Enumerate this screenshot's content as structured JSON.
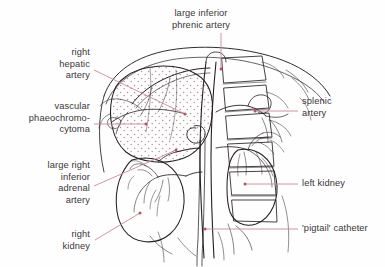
{
  "figure": {
    "kind": "medical-anatomical-illustration",
    "background_color": "#fefefe",
    "ink_color": "#262024",
    "leader_color": "#c98a95",
    "text_color": "#3a3538",
    "stipple_color": "#b9939c"
  },
  "labels": [
    {
      "id": "large-inferior-phrenic-artery",
      "lines": [
        "large inferior",
        "phrenic artery"
      ],
      "align": "center",
      "x": 138,
      "y": 8,
      "width": 126,
      "leader": {
        "from": [
          221,
          33
        ],
        "to": [
          221,
          69
        ]
      },
      "dot": [
        221,
        69
      ]
    },
    {
      "id": "right-hepatic-artery",
      "lines": [
        "right",
        "hepatic",
        "artery"
      ],
      "align": "right",
      "x": 12,
      "y": 47,
      "width": 78,
      "leader": {
        "from": [
          94,
          70
        ],
        "to": [
          185,
          114
        ]
      },
      "dot": [
        185,
        114
      ]
    },
    {
      "id": "vascular-phaeochromocytoma",
      "lines": [
        "vascular",
        "phaeochromo-",
        "cytoma"
      ],
      "align": "right",
      "x": 6,
      "y": 101,
      "width": 84,
      "leader": {
        "from": [
          94,
          124
        ],
        "to": [
          146,
          124
        ]
      },
      "dot": [
        146,
        124
      ]
    },
    {
      "id": "large-right-inferior-adrenal-artery",
      "lines": [
        "large right",
        "inferior",
        "adrenal",
        "artery"
      ],
      "align": "right",
      "x": 10,
      "y": 160,
      "width": 80,
      "leader": {
        "from": [
          94,
          186
        ],
        "to": [
          176,
          150
        ]
      },
      "dot": [
        176,
        150
      ]
    },
    {
      "id": "right-kidney",
      "lines": [
        "right",
        "kidney"
      ],
      "align": "right",
      "x": 28,
      "y": 229,
      "width": 62,
      "leader": {
        "from": [
          95,
          240
        ],
        "to": [
          140,
          213
        ]
      },
      "dot": [
        140,
        213
      ]
    },
    {
      "id": "splenic-artery",
      "lines": [
        "splenic",
        "artery"
      ],
      "align": "left",
      "x": 302,
      "y": 96,
      "width": 78,
      "leader": {
        "from": [
          298,
          111
        ],
        "to": [
          255,
          111
        ]
      },
      "dot": [
        255,
        111
      ]
    },
    {
      "id": "left-kidney",
      "lines": [
        "left kidney"
      ],
      "align": "left",
      "x": 302,
      "y": 178,
      "width": 78,
      "leader": {
        "from": [
          298,
          184
        ],
        "to": [
          245,
          184
        ]
      },
      "dot": [
        245,
        184
      ]
    },
    {
      "id": "pigtail-catheter",
      "lines": [
        "'pigtail' catheter"
      ],
      "align": "left",
      "x": 302,
      "y": 223,
      "width": 84,
      "leader": {
        "from": [
          298,
          229
        ],
        "to": [
          205,
          229
        ]
      },
      "dot": [
        205,
        229
      ]
    }
  ]
}
